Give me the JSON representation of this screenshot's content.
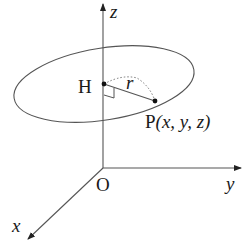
{
  "diagram": {
    "axes": {
      "z_label": "z",
      "y_label": "y",
      "x_label": "x",
      "origin_label": "O"
    },
    "points": {
      "H_label": "H",
      "P_label": "P",
      "P_coords": "(x, y, z)"
    },
    "radius_label": "r",
    "colors": {
      "line": "#555555",
      "dot": "#111111",
      "text": "#1a1a1a"
    }
  }
}
